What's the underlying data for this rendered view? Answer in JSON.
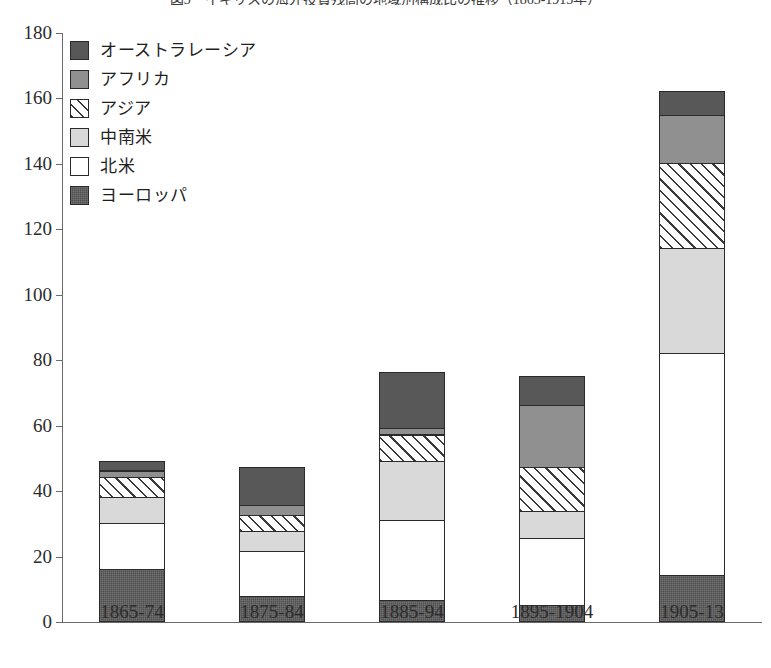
{
  "caption": "図3　イギリスの海外投資残高の地域別構成比の推移（1865-1913年）",
  "chart_data": {
    "type": "bar",
    "stacked": true,
    "title": "",
    "xlabel": "",
    "ylabel": "",
    "ylim": [
      0,
      180
    ],
    "ytick_step": 20,
    "yticks": [
      "0",
      "20",
      "40",
      "60",
      "80",
      "100",
      "120",
      "140",
      "160",
      "180"
    ],
    "grid": false,
    "legend_position": "top-left-inside",
    "categories": [
      "1865-74",
      "1875-84",
      "1885-94",
      "1895-1904",
      "1905-13"
    ],
    "series": [
      {
        "name": "ヨーロッパ",
        "key": "europe",
        "color": "#4f4f4f",
        "pattern": "solid-dark",
        "values": [
          16,
          7.5,
          6.5,
          5,
          14
        ]
      },
      {
        "name": "北米",
        "key": "namerica",
        "color": "#ffffff",
        "pattern": "empty",
        "values": [
          14,
          14,
          24.5,
          20.5,
          68
        ]
      },
      {
        "name": "中南米",
        "key": "lamerica",
        "color": "#d9d9d9",
        "pattern": "light-gray",
        "values": [
          8,
          6,
          18,
          8,
          32
        ]
      },
      {
        "name": "アジア",
        "key": "asia",
        "color": "#ffffff",
        "pattern": "diagonal-hatch",
        "values": [
          6,
          5,
          8,
          13.5,
          26
        ]
      },
      {
        "name": "アフリカ",
        "key": "africa",
        "color": "#909090",
        "pattern": "mid-gray",
        "values": [
          2,
          3,
          2,
          19,
          14.5
        ]
      },
      {
        "name": "オーストラレーシア",
        "key": "australasia",
        "color": "#585858",
        "pattern": "dark-gray",
        "values": [
          3,
          11.5,
          17,
          9,
          7.5
        ]
      }
    ],
    "totals": [
      49,
      47,
      76,
      75,
      162
    ]
  },
  "legend": {
    "items": [
      {
        "label": "オーストラレーシア",
        "key": "australasia"
      },
      {
        "label": "アフリカ",
        "key": "africa"
      },
      {
        "label": "アジア",
        "key": "asia"
      },
      {
        "label": "中南米",
        "key": "lamerica"
      },
      {
        "label": "北米",
        "key": "namerica"
      },
      {
        "label": "ヨーロッパ",
        "key": "europe"
      }
    ]
  }
}
